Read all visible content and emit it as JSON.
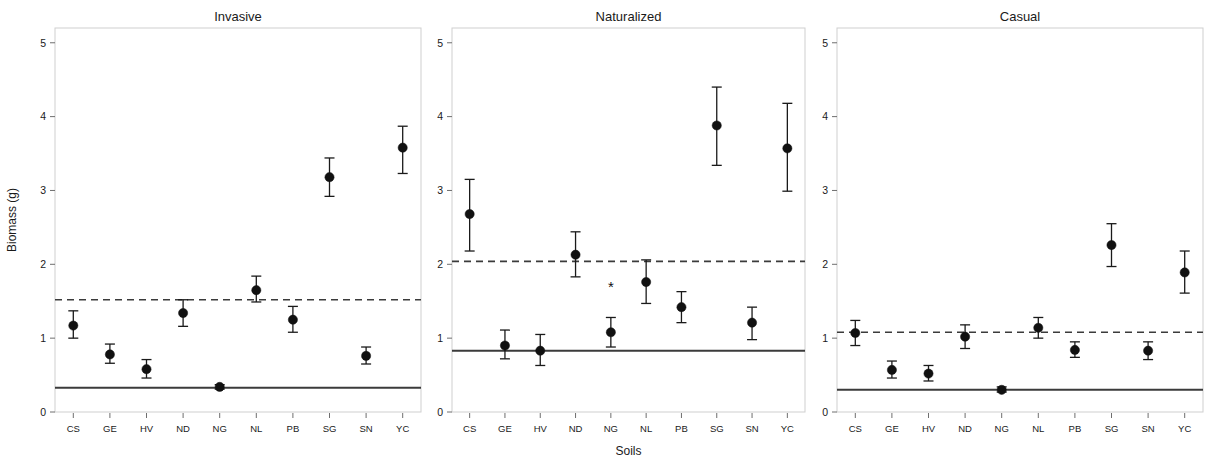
{
  "figure": {
    "xlabel": "Soils",
    "ylabel": "Biomass (g)"
  },
  "chart_data": [
    {
      "type": "scatter",
      "title": "Invasive",
      "xlabel": "Soils",
      "ylabel": "Biomass (g)",
      "ylim": [
        0,
        5.2
      ],
      "yticks": [
        0,
        1,
        2,
        3,
        4,
        5
      ],
      "ytick_labels": [
        "0",
        "1",
        "2",
        "3",
        "4",
        "5"
      ],
      "grid": false,
      "categories": [
        "CS",
        "GE",
        "HV",
        "ND",
        "NG",
        "NL",
        "PB",
        "SG",
        "SN",
        "YC"
      ],
      "values": [
        1.17,
        0.78,
        0.58,
        1.34,
        0.34,
        1.65,
        1.25,
        3.18,
        0.76,
        3.58
      ],
      "err_low": [
        1.0,
        0.66,
        0.46,
        1.16,
        0.31,
        1.49,
        1.08,
        2.92,
        0.65,
        3.23
      ],
      "err_high": [
        1.37,
        0.92,
        0.71,
        1.52,
        0.37,
        1.84,
        1.43,
        3.44,
        0.88,
        3.87
      ],
      "reference_lines": [
        {
          "label": "control-mean-solid",
          "value": 0.33,
          "style": "solid"
        },
        {
          "label": "reference-dashed",
          "value": 1.52,
          "style": "dashed"
        }
      ],
      "annotations": []
    },
    {
      "type": "scatter",
      "title": "Naturalized",
      "xlabel": "Soils",
      "ylabel": "Biomass (g)",
      "ylim": [
        0,
        5.2
      ],
      "yticks": [
        0,
        1,
        2,
        3,
        4,
        5
      ],
      "ytick_labels": [
        "0",
        "1",
        "2",
        "3",
        "4",
        "5"
      ],
      "grid": false,
      "categories": [
        "CS",
        "GE",
        "HV",
        "ND",
        "NG",
        "NL",
        "PB",
        "SG",
        "SN",
        "YC"
      ],
      "values": [
        2.68,
        0.9,
        0.83,
        2.13,
        1.08,
        1.76,
        1.42,
        3.88,
        1.21,
        3.57
      ],
      "err_low": [
        2.18,
        0.72,
        0.63,
        1.83,
        0.88,
        1.47,
        1.21,
        3.34,
        0.98,
        2.99
      ],
      "err_high": [
        3.15,
        1.11,
        1.05,
        2.44,
        1.28,
        2.06,
        1.63,
        4.4,
        1.42,
        4.18
      ],
      "reference_lines": [
        {
          "label": "control-mean-solid",
          "value": 0.83,
          "style": "solid"
        },
        {
          "label": "reference-dashed",
          "value": 2.04,
          "style": "dashed"
        }
      ],
      "annotations": [
        {
          "category": "NG",
          "symbol": "*",
          "value": 1.63
        }
      ]
    },
    {
      "type": "scatter",
      "title": "Casual",
      "xlabel": "Soils",
      "ylabel": "Biomass (g)",
      "ylim": [
        0,
        5.2
      ],
      "yticks": [
        0,
        1,
        2,
        3,
        4,
        5
      ],
      "ytick_labels": [
        "0",
        "1",
        "2",
        "3",
        "4",
        "5"
      ],
      "grid": false,
      "categories": [
        "CS",
        "GE",
        "HV",
        "ND",
        "NG",
        "NL",
        "PB",
        "SG",
        "SN",
        "YC"
      ],
      "values": [
        1.07,
        0.57,
        0.52,
        1.02,
        0.3,
        1.14,
        0.84,
        2.26,
        0.83,
        1.89
      ],
      "err_low": [
        0.9,
        0.46,
        0.42,
        0.86,
        0.27,
        1.0,
        0.74,
        1.97,
        0.71,
        1.61
      ],
      "err_high": [
        1.24,
        0.69,
        0.63,
        1.18,
        0.34,
        1.28,
        0.95,
        2.55,
        0.95,
        2.18
      ],
      "reference_lines": [
        {
          "label": "control-mean-solid",
          "value": 0.3,
          "style": "solid"
        },
        {
          "label": "reference-dashed",
          "value": 1.08,
          "style": "dashed"
        }
      ],
      "annotations": []
    }
  ]
}
